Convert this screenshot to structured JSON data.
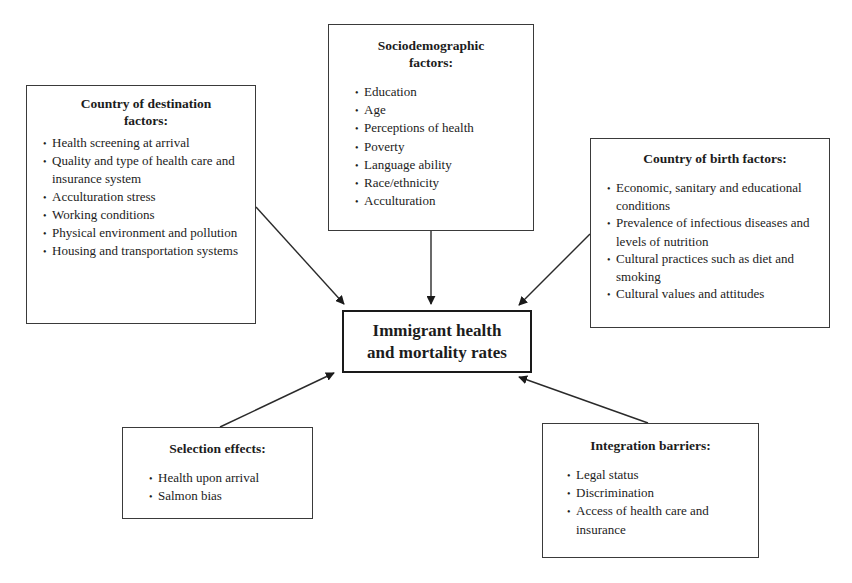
{
  "diagram": {
    "center": {
      "title_line1": "Immigrant health",
      "title_line2": "and mortality rates"
    },
    "boxes": {
      "destination": {
        "title_line1": "Country of destination",
        "title_line2": "factors:",
        "items": [
          "Health screening at arrival",
          "Quality and type of health care and insurance system",
          "Acculturation stress",
          "Working conditions",
          "Physical environment and pollution",
          "Housing and transportation systems"
        ]
      },
      "sociodemographic": {
        "title_line1": "Sociodemographic",
        "title_line2": "factors:",
        "items": [
          "Education",
          "Age",
          "Perceptions of health",
          "Poverty",
          "Language ability",
          "Race/ethnicity",
          "Acculturation"
        ]
      },
      "birth": {
        "title": "Country of birth factors:",
        "items": [
          "Economic, sanitary and educational conditions",
          "Prevalence of infectious diseases and levels of nutrition",
          "Cultural practices such as diet and smoking",
          "Cultural values and attitudes"
        ]
      },
      "selection": {
        "title": "Selection effects:",
        "items": [
          "Health upon arrival",
          "Salmon bias"
        ]
      },
      "integration": {
        "title": "Integration barriers:",
        "items": [
          "Legal status",
          "Discrimination",
          "Access of health care and insurance"
        ]
      }
    },
    "arrows": [
      {
        "from": "destination",
        "to": "center",
        "x1": 256,
        "y1": 207,
        "x2": 344,
        "y2": 304
      },
      {
        "from": "sociodemographic",
        "to": "center",
        "x1": 431,
        "y1": 231,
        "x2": 431,
        "y2": 304
      },
      {
        "from": "birth",
        "to": "center",
        "x1": 590,
        "y1": 234,
        "x2": 519,
        "y2": 305
      },
      {
        "from": "selection",
        "to": "center",
        "x1": 220,
        "y1": 427,
        "x2": 334,
        "y2": 373
      },
      {
        "from": "integration",
        "to": "center",
        "x1": 648,
        "y1": 423,
        "x2": 519,
        "y2": 377
      }
    ],
    "colors": {
      "line": "#2a2a2a",
      "background": "#ffffff"
    }
  }
}
